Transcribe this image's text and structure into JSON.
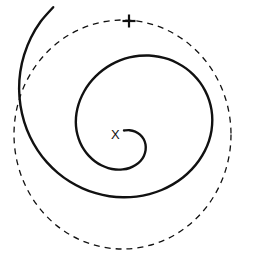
{
  "figure": {
    "background_color": "#ffffff",
    "width": 253,
    "height": 270,
    "center_label": "X",
    "endpoint_label": "+",
    "stroke_color": "#111111",
    "dashed_color": "#111111"
  },
  "chart_data": {
    "type": "line",
    "subtitle": "",
    "xlabel": "",
    "ylabel": "",
    "xlim": [
      0,
      253
    ],
    "ylim": [
      270,
      0
    ],
    "grid": false,
    "legend": "none",
    "annotations": [
      {
        "label": "X",
        "x": 117,
        "y": 134,
        "role": "spiral-origin-marker"
      },
      {
        "label": "+",
        "x": 129,
        "y": 21,
        "role": "spiral-endpoint-marker"
      }
    ],
    "series": [
      {
        "name": "spiral",
        "style": "solid",
        "linewidth": 2.4,
        "color": "#111111",
        "points": [
          [
            124.0,
            130.5
          ],
          [
            129.5,
            130.2
          ],
          [
            135.2,
            131.6
          ],
          [
            140.0,
            134.6
          ],
          [
            143.6,
            139.0
          ],
          [
            145.5,
            144.4
          ],
          [
            145.6,
            150.2
          ],
          [
            143.9,
            155.9
          ],
          [
            140.5,
            161.0
          ],
          [
            135.6,
            165.1
          ],
          [
            129.6,
            168.0
          ],
          [
            122.8,
            169.4
          ],
          [
            115.6,
            169.5
          ],
          [
            108.3,
            168.1
          ],
          [
            101.3,
            165.3
          ],
          [
            94.8,
            161.2
          ],
          [
            88.9,
            155.9
          ],
          [
            84.0,
            149.6
          ],
          [
            80.1,
            142.4
          ],
          [
            77.4,
            134.5
          ],
          [
            76.0,
            126.1
          ],
          [
            76.0,
            117.4
          ],
          [
            77.4,
            108.6
          ],
          [
            80.1,
            99.9
          ],
          [
            84.1,
            91.5
          ],
          [
            89.3,
            83.6
          ],
          [
            95.6,
            76.4
          ],
          [
            102.9,
            70.0
          ],
          [
            111.1,
            64.6
          ],
          [
            120.0,
            60.4
          ],
          [
            129.4,
            57.4
          ],
          [
            139.2,
            55.8
          ],
          [
            149.1,
            55.5
          ],
          [
            158.9,
            56.7
          ],
          [
            168.5,
            59.2
          ],
          [
            177.6,
            63.2
          ],
          [
            186.0,
            68.4
          ],
          [
            193.5,
            74.9
          ],
          [
            200.0,
            82.4
          ],
          [
            205.2,
            90.9
          ],
          [
            209.1,
            100.1
          ],
          [
            211.5,
            109.9
          ],
          [
            212.3,
            120.1
          ],
          [
            211.5,
            130.5
          ],
          [
            209.0,
            140.8
          ],
          [
            204.8,
            150.9
          ],
          [
            199.0,
            160.5
          ],
          [
            191.7,
            169.4
          ],
          [
            182.9,
            177.5
          ],
          [
            172.8,
            184.4
          ],
          [
            161.6,
            190.0
          ],
          [
            149.4,
            194.1
          ],
          [
            136.5,
            196.6
          ],
          [
            123.1,
            197.3
          ],
          [
            109.4,
            196.2
          ],
          [
            95.8,
            193.2
          ],
          [
            82.5,
            188.3
          ],
          [
            69.7,
            181.5
          ],
          [
            57.8,
            172.8
          ],
          [
            47.0,
            162.4
          ],
          [
            37.7,
            150.3
          ],
          [
            30.0,
            136.7
          ],
          [
            24.2,
            121.8
          ],
          [
            20.5,
            105.8
          ],
          [
            19.1,
            89.0
          ],
          [
            20.3,
            71.8
          ],
          [
            24.2,
            54.6
          ],
          [
            30.9,
            37.7
          ],
          [
            40.5,
            21.7
          ],
          [
            53.2,
            7.2
          ]
        ]
      },
      {
        "name": "bounding-circle",
        "style": "dashed",
        "linewidth": 1.3,
        "color": "#111111",
        "shape": "circle",
        "cx": 122.5,
        "cy": 134.5,
        "rx": 108.5,
        "ry": 114.5,
        "dash_pattern": "6 5"
      }
    ]
  }
}
